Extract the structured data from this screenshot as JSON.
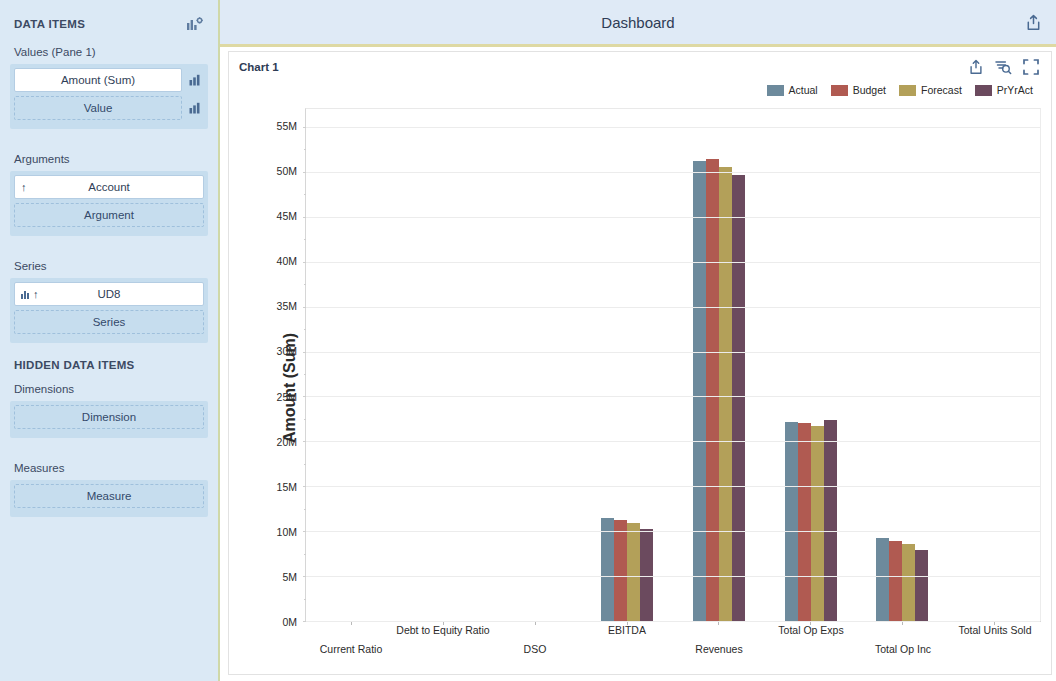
{
  "sidebar": {
    "header_title": "DATA ITEMS",
    "header_icon": "chart-settings-icon",
    "sections": [
      {
        "label": "Values (Pane 1)",
        "items": [
          {
            "text": "Amount (Sum)",
            "kind": "field",
            "ext_icon": "bar-chart-icon"
          },
          {
            "text": "Value",
            "kind": "placeholder",
            "ext_icon": "bar-chart-icon"
          }
        ]
      },
      {
        "label": "Arguments",
        "items": [
          {
            "text": "Account",
            "kind": "field",
            "lead_icon": "sort-asc-icon"
          },
          {
            "text": "Argument",
            "kind": "placeholder"
          }
        ]
      },
      {
        "label": "Series",
        "items": [
          {
            "text": "UD8",
            "kind": "field",
            "lead_icon": "sort-asc-icon",
            "lead_icon2": "group-icon"
          },
          {
            "text": "Series",
            "kind": "placeholder"
          }
        ]
      }
    ],
    "hidden_title": "HIDDEN DATA ITEMS",
    "hidden_sections": [
      {
        "label": "Dimensions",
        "items": [
          {
            "text": "Dimension",
            "kind": "placeholder"
          }
        ]
      },
      {
        "label": "Measures",
        "items": [
          {
            "text": "Measure",
            "kind": "placeholder"
          }
        ]
      }
    ]
  },
  "header": {
    "title": "Dashboard",
    "actions": [
      {
        "name": "export-icon"
      }
    ]
  },
  "chart_card": {
    "title": "Chart 1",
    "actions": [
      {
        "name": "export-icon"
      },
      {
        "name": "filter-search-icon"
      },
      {
        "name": "fullscreen-icon"
      }
    ]
  },
  "colors": {
    "actual": "#6d8a9c",
    "budget": "#b05a51",
    "forecast": "#b3a059",
    "pryract": "#6b4a5e",
    "sidebar_bg": "#dbe9f5",
    "header_bg": "#dfeaf6",
    "accent_rule": "#ded9a3"
  },
  "chart_data": {
    "type": "bar",
    "title": "Chart 1",
    "xlabel": "",
    "ylabel": "Amount (Sum)",
    "ylim": [
      0,
      57000000
    ],
    "ytick_values": [
      0,
      5000000,
      10000000,
      15000000,
      20000000,
      25000000,
      30000000,
      35000000,
      40000000,
      45000000,
      50000000,
      55000000
    ],
    "ytick_labels": [
      "0M",
      "5M",
      "10M",
      "15M",
      "20M",
      "25M",
      "30M",
      "35M",
      "40M",
      "45M",
      "50M",
      "55M"
    ],
    "grid": true,
    "legend_position": "top-right",
    "categories": [
      "Current Ratio",
      "Debt to Equity Ratio",
      "DSO",
      "EBITDA",
      "Revenues",
      "Total Op Exps",
      "Total Op Inc",
      "Total Units Sold"
    ],
    "series": [
      {
        "name": "Actual",
        "color": "#6d8a9c",
        "values": [
          0,
          0,
          0,
          11500000,
          51200000,
          22200000,
          9200000,
          0
        ]
      },
      {
        "name": "Budget",
        "color": "#b05a51",
        "values": [
          0,
          0,
          0,
          11300000,
          51400000,
          22000000,
          8900000,
          0
        ]
      },
      {
        "name": "Forecast",
        "color": "#b3a059",
        "values": [
          0,
          0,
          0,
          10900000,
          50600000,
          21700000,
          8600000,
          0
        ]
      },
      {
        "name": "PrYrAct",
        "color": "#6b4a5e",
        "values": [
          0,
          0,
          0,
          10200000,
          49700000,
          22400000,
          7900000,
          0
        ]
      }
    ]
  }
}
